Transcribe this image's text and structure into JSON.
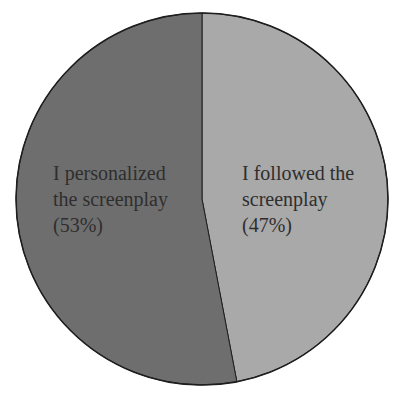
{
  "chart_data": {
    "type": "pie",
    "title": "",
    "categories": [
      "I followed the screenplay",
      "I personalized the screenplay"
    ],
    "values": [
      47,
      53
    ],
    "unit": "%",
    "series": [
      {
        "name": "I followed the screenplay",
        "value": 47,
        "color": "#a9a9a9",
        "label_lines": [
          "I followed the",
          "screenplay",
          "(47%)"
        ]
      },
      {
        "name": "I personalized the screenplay",
        "value": 53,
        "color": "#6e6e6e",
        "label_lines": [
          "I personalized",
          "the screenplay",
          "(53%)"
        ]
      }
    ],
    "start_angle_deg": 0,
    "direction": "clockwise",
    "legend": "none",
    "labels_inside": true
  },
  "labels": {
    "followed": "I followed the\nscreenplay\n(47%)",
    "personalized": "I personalized\nthe screenplay\n(53%)"
  },
  "colors": {
    "outline": "#1e1e1e",
    "text": "#2e2e2e"
  }
}
